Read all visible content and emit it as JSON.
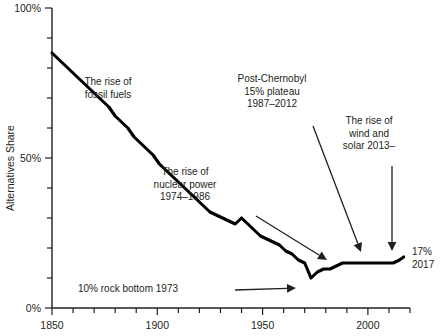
{
  "chart_data": {
    "type": "line",
    "title": "",
    "xlabel": "",
    "ylabel": "Alternatives Share",
    "xlim": [
      1850,
      2020
    ],
    "ylim": [
      0,
      100
    ],
    "grid": false,
    "legend": "none",
    "x_ticks_major": [
      1850,
      1900,
      1950,
      2000
    ],
    "x_ticks_minor_step": 10,
    "y_ticks_major": [
      0,
      50,
      100
    ],
    "y_tick_labels": [
      "0%",
      "50%",
      "100%"
    ],
    "y_ticks_minor_step": 10,
    "series": [
      {
        "name": "Alternatives share of primary energy",
        "unit": "percent",
        "x": [
          1850,
          1853,
          1856,
          1859,
          1862,
          1865,
          1868,
          1871,
          1874,
          1877,
          1880,
          1883,
          1886,
          1889,
          1892,
          1895,
          1898,
          1901,
          1904,
          1907,
          1910,
          1913,
          1916,
          1919,
          1922,
          1925,
          1928,
          1931,
          1934,
          1937,
          1940,
          1943,
          1946,
          1949,
          1952,
          1955,
          1958,
          1961,
          1964,
          1967,
          1970,
          1973,
          1976,
          1979,
          1982,
          1985,
          1988,
          1991,
          1994,
          1997,
          2000,
          2003,
          2006,
          2009,
          2012,
          2015,
          2017
        ],
        "values": [
          85,
          83,
          81,
          79,
          77,
          75,
          73,
          71,
          69,
          67,
          64,
          62,
          60,
          57,
          55,
          53,
          51,
          48,
          46,
          44,
          42,
          40,
          38,
          36,
          34,
          32,
          31,
          30,
          29,
          28,
          30,
          28,
          26,
          24,
          23,
          22,
          21,
          19,
          18,
          16,
          15,
          10,
          12,
          13,
          13,
          14,
          15,
          15,
          15,
          15,
          15,
          15,
          15,
          15,
          15,
          16,
          17
        ]
      }
    ],
    "annotations": [
      {
        "id": "fossil-fuels",
        "lines": [
          "The rise of",
          "fossil fuels"
        ],
        "text_x": 108,
        "text_y": 85,
        "arrow": null
      },
      {
        "id": "nuclear-power",
        "lines": [
          "The rise of",
          "nuclear power",
          "1974–1986"
        ],
        "text_x": 185,
        "text_y": 175,
        "arrow": {
          "x1": 256,
          "y1": 216,
          "x2": 327,
          "y2": 260
        }
      },
      {
        "id": "post-chernobyl",
        "lines": [
          "Post-Chernobyl",
          "15% plateau",
          "1987–2012"
        ],
        "text_x": 272,
        "text_y": 82,
        "arrow": {
          "x1": 313,
          "y1": 126,
          "x2": 361,
          "y2": 252
        }
      },
      {
        "id": "wind-and-solar",
        "lines": [
          "The rise of",
          "wind and",
          "solar 2013–"
        ],
        "text_x": 369,
        "text_y": 124,
        "arrow": {
          "x1": 392,
          "y1": 166,
          "x2": 392,
          "y2": 251
        }
      },
      {
        "id": "rock-bottom",
        "lines": [
          "10% rock bottom 1973"
        ],
        "text_x": 128,
        "text_y": 292,
        "arrow": {
          "x1": 235,
          "y1": 290,
          "x2": 296,
          "y2": 288
        }
      }
    ],
    "end_label": {
      "lines": [
        "17%",
        "2017"
      ],
      "x": 412,
      "y": 255
    }
  },
  "axis": {
    "x_tick_labels": [
      "1850",
      "1900",
      "1950",
      "2000"
    ],
    "y_axis_title": "Alternatives Share",
    "y_tick_labels": [
      "0%",
      "50%",
      "100%"
    ]
  }
}
